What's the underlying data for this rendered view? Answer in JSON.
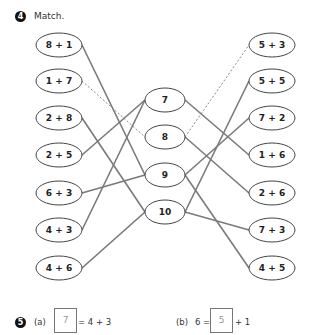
{
  "question4": {
    "number": "4",
    "title": "Match.",
    "left_items": [
      {
        "label": "8 + 1",
        "x": 59,
        "y": 45
      },
      {
        "label": "1 + 7",
        "x": 59,
        "y": 81
      },
      {
        "label": "2 + 8",
        "x": 59,
        "y": 118
      },
      {
        "label": "2 + 5",
        "x": 59,
        "y": 155
      },
      {
        "label": "6 + 3",
        "x": 59,
        "y": 193
      },
      {
        "label": "4 + 3",
        "x": 59,
        "y": 230
      },
      {
        "label": "4 + 6",
        "x": 59,
        "y": 268
      }
    ],
    "middle_items": [
      {
        "label": "7",
        "x": 165,
        "y": 100
      },
      {
        "label": "8",
        "x": 165,
        "y": 137
      },
      {
        "label": "9",
        "x": 165,
        "y": 175
      },
      {
        "label": "10",
        "x": 165,
        "y": 212
      }
    ],
    "right_items": [
      {
        "label": "5 + 3",
        "x": 272,
        "y": 45
      },
      {
        "label": "5 + 5",
        "x": 272,
        "y": 81
      },
      {
        "label": "7 + 2",
        "x": 272,
        "y": 118
      },
      {
        "label": "1 + 6",
        "x": 272,
        "y": 155
      },
      {
        "label": "2 + 6",
        "x": 272,
        "y": 193
      },
      {
        "label": "7 + 3",
        "x": 272,
        "y": 230
      },
      {
        "label": "4 + 5",
        "x": 272,
        "y": 268
      }
    ],
    "left_connections": [
      {
        "from": "8 + 1",
        "to": "9",
        "style": "solid"
      },
      {
        "from": "1 + 7",
        "to": "8",
        "style": "dashed"
      },
      {
        "from": "2 + 8",
        "to": "10",
        "style": "solid"
      },
      {
        "from": "2 + 5",
        "to": "7",
        "style": "solid"
      },
      {
        "from": "6 + 3",
        "to": "9",
        "style": "solid"
      },
      {
        "from": "4 + 3",
        "to": "7",
        "style": "solid"
      },
      {
        "from": "4 + 6",
        "to": "10",
        "style": "solid"
      }
    ],
    "right_connections": [
      {
        "from": "7",
        "to": "1 + 6",
        "style": "solid"
      },
      {
        "from": "8",
        "to": "5 + 3",
        "style": "dashed"
      },
      {
        "from": "8",
        "to": "2 + 6",
        "style": "solid"
      },
      {
        "from": "9",
        "to": "7 + 2",
        "style": "solid"
      },
      {
        "from": "9",
        "to": "4 + 5",
        "style": "solid"
      },
      {
        "from": "10",
        "to": "5 + 5",
        "style": "solid"
      },
      {
        "from": "10",
        "to": "7 + 3",
        "style": "solid"
      }
    ]
  },
  "question5": {
    "number": "5",
    "part_a": {
      "label": "(a)",
      "answer": "7",
      "suffix": "= 4 + 3"
    },
    "part_b": {
      "label": "(b)",
      "prefix": "6 =",
      "answer": "5",
      "suffix": "+ 1"
    }
  },
  "colors": {
    "line": "#7a7a7a",
    "oval_border": "#444444",
    "answer_text": "#999999"
  }
}
